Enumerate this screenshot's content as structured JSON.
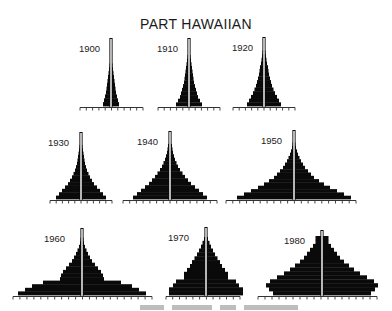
{
  "title": "PART HAWAIIAN",
  "colors": {
    "bar": "#0a0a0a",
    "axis": "#333333",
    "center_line": "#ffffff",
    "background": "#ffffff"
  },
  "chart_data": {
    "type": "population-pyramid",
    "title": "PART HAWAIIAN",
    "xlabel": "",
    "ylabel": "",
    "tick_labels": [],
    "panels": [
      {
        "year": "1900",
        "row": 0,
        "cx": 111,
        "base": 107,
        "axis": [
          80,
          143
        ],
        "ticks": 10,
        "half_widths": [
          8,
          7,
          6,
          5,
          4.5,
          4,
          3.5,
          3,
          2.5,
          2,
          1.5,
          1,
          1,
          1,
          0.5,
          0.5
        ],
        "top": 38
      },
      {
        "year": "1910",
        "row": 0,
        "cx": 189,
        "base": 107,
        "axis": [
          158,
          220
        ],
        "ticks": 10,
        "half_widths": [
          13,
          11,
          9,
          8,
          7,
          6,
          5,
          4.5,
          4,
          3.5,
          3,
          2.5,
          2,
          1.5,
          1,
          1,
          0.5
        ],
        "top": 38
      },
      {
        "year": "1920",
        "row": 0,
        "cx": 264,
        "base": 107,
        "axis": [
          233,
          295
        ],
        "ticks": 10,
        "half_widths": [
          17,
          15,
          13,
          11,
          9.5,
          8,
          7,
          6,
          5,
          4.5,
          4,
          3,
          2.5,
          2,
          1.5,
          1,
          0.5
        ],
        "top": 37
      },
      {
        "year": "1930",
        "row": 1,
        "cx": 81,
        "base": 200,
        "axis": [
          50,
          112
        ],
        "ticks": 10,
        "half_widths": [
          25,
          22,
          19,
          16,
          13,
          11,
          9,
          7.5,
          6,
          5,
          4,
          3.5,
          3,
          2.5,
          2,
          1.5,
          1,
          0.5
        ],
        "top": 132
      },
      {
        "year": "1940",
        "row": 1,
        "cx": 170,
        "base": 200,
        "axis": [
          123,
          217
        ],
        "ticks": 14,
        "half_widths": [
          37,
          33,
          29,
          25,
          21,
          18,
          15,
          12.5,
          10,
          8,
          6.5,
          5,
          4,
          3,
          2.5,
          2,
          1,
          0.5
        ],
        "top": 131
      },
      {
        "year": "1950",
        "row": 1,
        "cx": 294,
        "base": 200,
        "axis": [
          226,
          356
        ],
        "ticks": 19,
        "half_widths": [
          57,
          50,
          43,
          36,
          30,
          25,
          20,
          17,
          14,
          11,
          9,
          7,
          5.5,
          4,
          3,
          2,
          1.5,
          1,
          0.5
        ],
        "top": 130
      },
      {
        "year": "1960",
        "row": 2,
        "cx": 82,
        "base": 296,
        "axis": [
          13,
          152
        ],
        "ticks": 20,
        "half_widths": [
          64,
          57,
          50,
          39,
          22,
          21,
          19,
          16,
          13,
          10,
          8,
          6,
          4.5,
          3,
          2,
          1.5,
          1
        ],
        "top": 228
      },
      {
        "year": "1970",
        "row": 2,
        "cx": 206,
        "base": 296,
        "axis": [
          166,
          240
        ],
        "ticks": 11,
        "half_widths": [
          37,
          37,
          33,
          30,
          22,
          22,
          19,
          16,
          14,
          11.5,
          9,
          7,
          5,
          3.5,
          2,
          1
        ],
        "top": 227
      },
      {
        "year": "1980",
        "row": 2,
        "cx": 322,
        "base": 296,
        "axis": [
          258,
          377
        ],
        "ticks": 17,
        "half_widths": [
          49,
          53,
          56,
          52,
          45,
          38,
          32,
          27,
          22,
          18,
          15,
          12,
          9,
          6.5,
          6.5
        ],
        "top": 230
      }
    ]
  },
  "caption_fragment": "...Hawaiian and Part-Hawaiian..."
}
